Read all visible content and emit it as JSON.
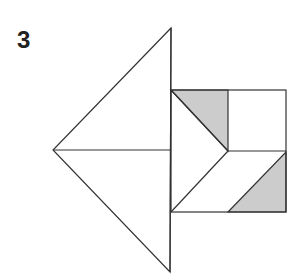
{
  "figure": {
    "label": "3",
    "colors": {
      "stroke": "#333333",
      "fill_shaded": "#cccccc",
      "fill_white": "#ffffff"
    },
    "shapes": {
      "big_triangle_top": [
        [
          171,
          28
        ],
        [
          53,
          150
        ],
        [
          171,
          150
        ]
      ],
      "big_triangle_bottom": [
        [
          53,
          150
        ],
        [
          171,
          150
        ],
        [
          170,
          272
        ]
      ],
      "square": [
        [
          171,
          90
        ],
        [
          286,
          90
        ],
        [
          286,
          212
        ],
        [
          171,
          212
        ]
      ],
      "shaded_triangle_top": [
        [
          171,
          90
        ],
        [
          228,
          90
        ],
        [
          228,
          151
        ]
      ],
      "shaded_triangle_bottom": [
        [
          228,
          212
        ],
        [
          286,
          152
        ],
        [
          286,
          212
        ]
      ]
    }
  }
}
